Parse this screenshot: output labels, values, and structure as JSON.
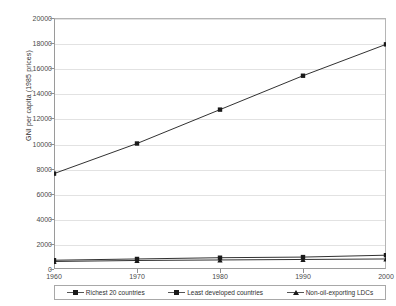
{
  "chart_data": {
    "type": "line",
    "title": "",
    "xlabel": "",
    "ylabel": "GNI per capita (1985 prices)",
    "x": [
      1960,
      1970,
      1980,
      1990,
      2000
    ],
    "xticklabels": [
      "1960",
      "1970",
      "1980",
      "1990",
      "2000"
    ],
    "yticks": [
      0,
      2000,
      4000,
      6000,
      8000,
      10000,
      12000,
      14000,
      16000,
      18000,
      20000
    ],
    "yticklabels": [
      "0",
      "2000",
      "4000",
      "6000",
      "8000",
      "10000",
      "12000",
      "14000",
      "16000",
      "18000",
      "20000"
    ],
    "ylim": [
      0,
      20000
    ],
    "xlim": [
      1960,
      2000
    ],
    "grid": true,
    "legend_position": "bottom",
    "series": [
      {
        "name": "Richest 20 countries",
        "marker": "square",
        "color": "#1a1a1a",
        "values": [
          7600,
          10000,
          12700,
          15400,
          17900
        ]
      },
      {
        "name": "Least developed countries",
        "marker": "square",
        "color": "#1a1a1a",
        "values": [
          700,
          800,
          900,
          950,
          1100
        ]
      },
      {
        "name": "Non-oil-exporting LDCs",
        "marker": "triangle",
        "color": "#1a1a1a",
        "values": [
          600,
          680,
          720,
          760,
          800
        ]
      }
    ]
  }
}
